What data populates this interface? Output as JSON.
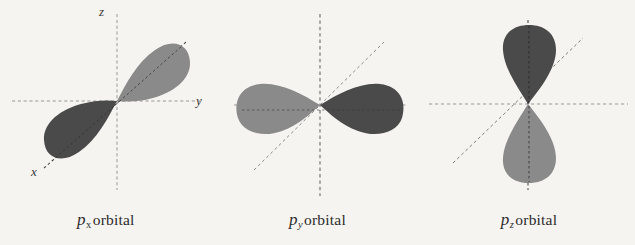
{
  "figure": {
    "background_color": "#f6f4f1",
    "lobe_color_light": "#8a8a8a",
    "lobe_color_dark": "#4a4a4a",
    "axis_color": "#9a9a9a",
    "node_axis_color": "#555555"
  },
  "panels": [
    {
      "id": "px",
      "caption": {
        "symbol": "p",
        "subscript": "x",
        "subscript_style": "roman",
        "text": "orbital",
        "full": "p_x orbital"
      },
      "axes": [
        {
          "name": "z",
          "label": "z",
          "orientation": "vertical",
          "label_x": 103,
          "label_y": 9
        },
        {
          "name": "y",
          "label": "y",
          "orientation": "horizontal",
          "label_x": 197,
          "label_y": 92
        },
        {
          "name": "x",
          "label": "x",
          "orientation": "diagonal",
          "label_x": 33,
          "label_y": 163
        }
      ],
      "orientation": "tilted",
      "tilt_degrees": -33,
      "lobes": [
        {
          "sign": "positive",
          "shade": "light",
          "direction": "upper-right"
        },
        {
          "sign": "negative",
          "shade": "dark",
          "direction": "lower-left"
        }
      ]
    },
    {
      "id": "py",
      "caption": {
        "symbol": "p",
        "subscript": "y",
        "subscript_style": "italic",
        "text": "orbital",
        "full": "p_y orbital"
      },
      "axes": [
        {
          "name": "z",
          "label": "",
          "orientation": "vertical"
        },
        {
          "name": "y",
          "label": "",
          "orientation": "horizontal"
        },
        {
          "name": "x",
          "label": "",
          "orientation": "diagonal"
        }
      ],
      "orientation": "horizontal",
      "tilt_degrees": 0,
      "lobes": [
        {
          "sign": "negative",
          "shade": "light",
          "direction": "left"
        },
        {
          "sign": "positive",
          "shade": "dark",
          "direction": "right"
        }
      ]
    },
    {
      "id": "pz",
      "caption": {
        "symbol": "p",
        "subscript": "z",
        "subscript_style": "italic",
        "text": "orbital",
        "full": "p_z orbital"
      },
      "axes": [
        {
          "name": "z",
          "label": "",
          "orientation": "vertical"
        },
        {
          "name": "y",
          "label": "",
          "orientation": "horizontal"
        },
        {
          "name": "x",
          "label": "",
          "orientation": "diagonal"
        }
      ],
      "orientation": "vertical",
      "tilt_degrees": 90,
      "lobes": [
        {
          "sign": "positive",
          "shade": "dark",
          "direction": "up"
        },
        {
          "sign": "negative",
          "shade": "light",
          "direction": "down"
        }
      ]
    }
  ]
}
